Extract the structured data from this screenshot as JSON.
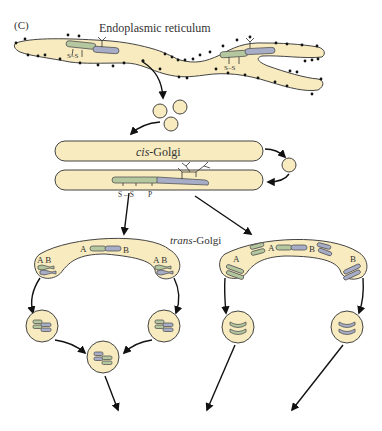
{
  "figure": {
    "panel_label": "(C)",
    "colors": {
      "membrane_fill": "#f7ebbf",
      "membrane_stroke": "#444444",
      "segment_A_green": "#b4c79e",
      "segment_B_blue": "#a7adc6",
      "arrow": "#111111",
      "ribosome": "#111111"
    }
  },
  "er": {
    "title": "Endoplasmic reticulum",
    "protein_left": {
      "bond_label": "S–S"
    },
    "protein_right": {
      "bond_label": "S–S"
    }
  },
  "cis_golgi": {
    "title_italic": "cis",
    "title_rest": "-Golgi",
    "protein": {
      "label_ss": "S – S",
      "label_p": "P"
    }
  },
  "trans_golgi": {
    "title_italic": "trans",
    "title_rest": "-Golgi",
    "left": {
      "center_label_a": "A",
      "center_label_b": "B",
      "left_lobe_label": "A B",
      "right_lobe_label": "A B"
    },
    "right": {
      "center_label_a": "A",
      "center_label_b": "B",
      "left_lobe_label": "A",
      "right_lobe_label": "B"
    }
  }
}
